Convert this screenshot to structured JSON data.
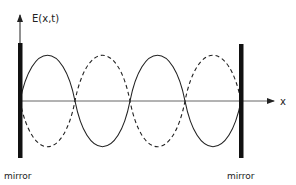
{
  "diagram": {
    "type": "standing-wave",
    "y_axis_label": "E(x,t)",
    "x_axis_label": "x",
    "left_mirror_label": "mirror",
    "right_mirror_label": "mirror",
    "num_half_wavelengths": 4,
    "curves": [
      {
        "name": "solid",
        "style": "solid",
        "description": "E(x,t) at one instant"
      },
      {
        "name": "dashed",
        "style": "dashed",
        "description": "E(x,t) half a period later (inverted)"
      }
    ],
    "colors": {
      "line": "#222222",
      "axis": "#555555",
      "mirror": "#111111",
      "background": "#ffffff"
    }
  }
}
